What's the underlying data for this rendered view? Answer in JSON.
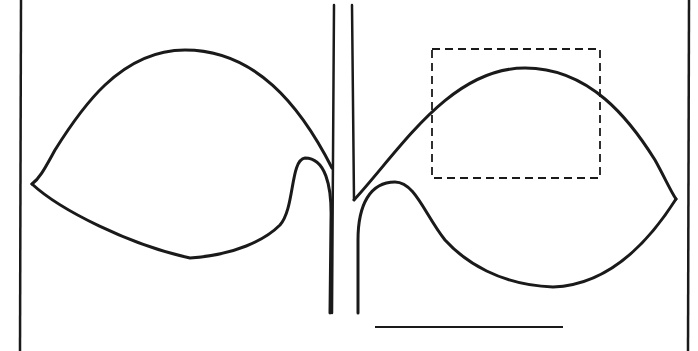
{
  "figure": {
    "type": "line-drawing",
    "background_color": "#ffffff",
    "line_color": "#1a1a1a",
    "frame": {
      "left_border_x": 21,
      "right_border_x": 688
    },
    "stem": {
      "left_line": {
        "x1": 334,
        "y1": 5,
        "x2": 332,
        "y2": 313
      },
      "right_line": {
        "x1": 352,
        "y1": 5,
        "x2": 358,
        "y2": 313
      }
    },
    "leaves": [
      {
        "name": "left-leaf",
        "tip": [
          32,
          184
        ],
        "apex_upper": [
          185,
          50
        ],
        "lowest_point": [
          190,
          258
        ],
        "basal_lobe_peak": [
          305,
          158
        ]
      },
      {
        "name": "right-leaf",
        "tip": [
          676,
          199
        ],
        "apex_upper": [
          525,
          68
        ],
        "lowest_point": [
          553,
          287
        ],
        "basal_lobe_peak": [
          395,
          182
        ]
      }
    ],
    "inset_box": {
      "x": 432,
      "y": 49,
      "width": 168,
      "height": 129,
      "style": "dashed"
    },
    "scale_bar": {
      "x1": 375,
      "y1": 327,
      "x2": 563,
      "y2": 327
    },
    "labels": []
  }
}
